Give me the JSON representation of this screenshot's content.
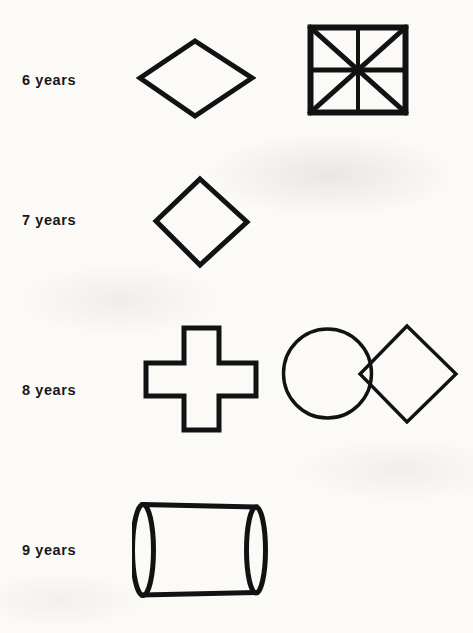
{
  "page": {
    "background_color": "#fbfaf7",
    "ink_color": "#121214",
    "width": 473,
    "height": 633
  },
  "rows": [
    {
      "age_label": "6 years",
      "label_x": 22,
      "label_y": 72,
      "figures": [
        {
          "name": "wide-rhombus",
          "shape": "rhombus",
          "x": 139,
          "y": 40,
          "width": 113,
          "height": 76,
          "stroke_width": 5
        },
        {
          "name": "divided-square",
          "shape": "square-with-diagonals-and-medians",
          "x": 309,
          "y": 26,
          "width": 99,
          "height": 89,
          "stroke_width": 5,
          "sectors": 8
        }
      ]
    },
    {
      "age_label": "7 years",
      "label_x": 22,
      "label_y": 212,
      "figures": [
        {
          "name": "diamond",
          "shape": "square-rotated-45",
          "x": 155,
          "y": 178,
          "width": 92,
          "height": 87,
          "stroke_width": 5
        }
      ]
    },
    {
      "age_label": "8 years",
      "label_x": 22,
      "label_y": 382,
      "figures": [
        {
          "name": "greek-cross",
          "shape": "cross",
          "x": 144,
          "y": 327,
          "width": 116,
          "height": 105,
          "stroke_width": 5,
          "arm_ratio": 0.34
        },
        {
          "name": "circle-diamond-overlap",
          "shape": "circle-and-diamond-intersecting",
          "x": 282,
          "y": 324,
          "width": 176,
          "height": 97,
          "stroke_width": 3
        }
      ]
    },
    {
      "age_label": "9 years",
      "label_x": 22,
      "label_y": 552,
      "figures": [
        {
          "name": "cylinder",
          "shape": "cylinder-3d",
          "x": 136,
          "y": 500,
          "width": 134,
          "height": 97,
          "stroke_width": 5
        }
      ]
    }
  ]
}
